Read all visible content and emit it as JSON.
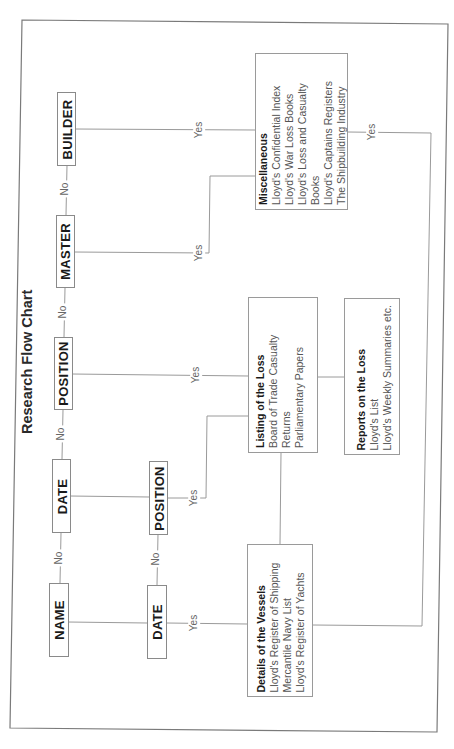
{
  "title": "Research Flow Chart",
  "questions": {
    "row1": [
      {
        "id": "name",
        "label": "NAME"
      },
      {
        "id": "date",
        "label": "DATE"
      },
      {
        "id": "position",
        "label": "POSITION"
      },
      {
        "id": "master",
        "label": "MASTER"
      },
      {
        "id": "builder",
        "label": "BUILDER"
      }
    ],
    "row2": [
      {
        "id": "date2",
        "label": "DATE"
      },
      {
        "id": "position2",
        "label": "POSITION"
      }
    ]
  },
  "edge_labels": {
    "no": "No",
    "yes": "Yes"
  },
  "sources": {
    "details": {
      "heading": "Details of the Vessels",
      "items": [
        "Lloyd's Register of Shipping",
        "Mercantile Navy List",
        "Lloyd's Register of Yachts"
      ]
    },
    "listing": {
      "heading": "Listing of the Loss",
      "items": [
        "Board of Trade Casualty Returns",
        "Parliamentary Papers"
      ]
    },
    "reports": {
      "heading": "Reports on the Loss",
      "items": [
        "Lloyd's List",
        "Lloyd's Weekly Summaries etc."
      ]
    },
    "misc": {
      "heading": "Miscellaneous",
      "items": [
        "Lloyd's Confidential Index",
        "Lloyd's War Loss Books",
        "Lloyd's Loss and Casualty Books",
        "Lloyd's Captains Registers",
        "The Shipbuilding Industry"
      ]
    }
  },
  "colors": {
    "line": "#9a9a9a",
    "frame": "#7a7a7a",
    "text": "#222222"
  }
}
